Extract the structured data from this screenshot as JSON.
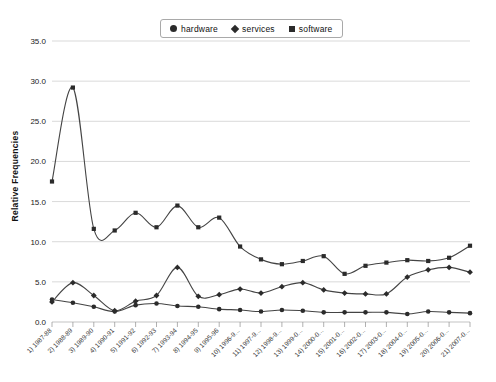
{
  "chart_data": {
    "type": "line",
    "title": "",
    "xlabel": "",
    "ylabel": "Relative Frequencies",
    "ylim": [
      0.0,
      35.0
    ],
    "yticks": [
      "0.0",
      "5.0",
      "10.0",
      "15.0",
      "20.0",
      "25.0",
      "30.0",
      "35.0"
    ],
    "ytick_values": [
      0.0,
      5.0,
      10.0,
      15.0,
      20.0,
      25.0,
      30.0,
      35.0
    ],
    "grid": true,
    "legend_position": "top-center",
    "categories": [
      "1) 1987-88",
      "2) 1988-89",
      "3) 1989-90",
      "4) 1990-91",
      "5) 1991-92",
      "6) 1992-93",
      "7) 1993-94",
      "8) 1994-95",
      "9) 1995-96",
      "10) 1996-9...",
      "11) 1997-9...",
      "12) 1998-9...",
      "13) 1999-0...",
      "14) 2000-0...",
      "15) 2001-0...",
      "16) 2002-0...",
      "17) 2003-0...",
      "18) 2004-0...",
      "19) 2005-0...",
      "20) 2006-0...",
      "21) 2007-0..."
    ],
    "series": [
      {
        "name": "hardware",
        "marker": "circle",
        "values": [
          2.8,
          2.4,
          1.9,
          1.3,
          2.1,
          2.3,
          2.0,
          1.9,
          1.6,
          1.5,
          1.3,
          1.5,
          1.4,
          1.2,
          1.2,
          1.2,
          1.2,
          1.0,
          1.3,
          1.2,
          1.1
        ]
      },
      {
        "name": "services",
        "marker": "diamond",
        "values": [
          2.5,
          4.9,
          3.3,
          1.4,
          2.6,
          3.3,
          6.8,
          3.2,
          3.4,
          4.1,
          3.6,
          4.4,
          4.9,
          4.0,
          3.6,
          3.5,
          3.5,
          5.6,
          6.5,
          6.8,
          6.2
        ]
      },
      {
        "name": "software",
        "marker": "square",
        "values": [
          17.5,
          29.2,
          11.6,
          11.4,
          13.6,
          11.8,
          14.5,
          11.8,
          13.0,
          9.4,
          7.8,
          7.2,
          7.6,
          8.2,
          6.0,
          7.0,
          7.4,
          7.7,
          7.6,
          8.0,
          9.5
        ]
      }
    ]
  },
  "legend": {
    "items": [
      {
        "label": "hardware",
        "marker": "circle"
      },
      {
        "label": "services",
        "marker": "diamond"
      },
      {
        "label": "software",
        "marker": "square"
      }
    ]
  },
  "colors": {
    "line": "#444444",
    "marker": "#2b2b2b",
    "grid": "#c9c9c9",
    "axis": "#b4b4b4",
    "text": "#1a1a1a",
    "background": "#ffffff"
  }
}
